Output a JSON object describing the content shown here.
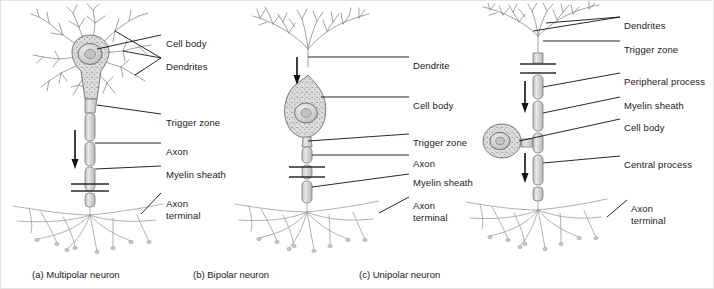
{
  "figure": {
    "background_color": "#ffffff",
    "ink_color": "#1a1a1a",
    "cell_fill_color": "#d9d9d9",
    "process_fill_color": "#cfcfcf",
    "dendrite_stroke_color": "#6e6e6e",
    "terminal_stroke_color": "#9a9a9a"
  },
  "panels": [
    {
      "id": "a",
      "caption": "(a) Multipolar neuron",
      "caption_x": 31,
      "caption_y": 268,
      "labels": [
        {
          "text": "Cell body",
          "x": 165,
          "y": 37
        },
        {
          "text": "Dendrites",
          "x": 165,
          "y": 60
        },
        {
          "text": "Trigger zone",
          "x": 165,
          "y": 116
        },
        {
          "text": "Axon",
          "x": 165,
          "y": 145
        },
        {
          "text": "Myelin sheath",
          "x": 165,
          "y": 168
        },
        {
          "text": "Axon",
          "x": 165,
          "y": 197
        },
        {
          "text": "terminal",
          "x": 165,
          "y": 209
        }
      ]
    },
    {
      "id": "b",
      "caption": "(b) Bipolar neuron",
      "caption_x": 192,
      "caption_y": 268,
      "labels": [
        {
          "text": "Dendrite",
          "x": 412,
          "y": 59
        },
        {
          "text": "Cell body",
          "x": 412,
          "y": 99
        },
        {
          "text": "Trigger zone",
          "x": 412,
          "y": 136
        },
        {
          "text": "Axon",
          "x": 412,
          "y": 157
        },
        {
          "text": "Myelin sheath",
          "x": 412,
          "y": 176
        },
        {
          "text": "Axon",
          "x": 412,
          "y": 199
        },
        {
          "text": "terminal",
          "x": 412,
          "y": 211
        }
      ]
    },
    {
      "id": "c",
      "caption": "(c) Unipolar neuron",
      "caption_x": 358,
      "caption_y": 268,
      "labels": [
        {
          "text": "Dendrites",
          "x": 623,
          "y": 19
        },
        {
          "text": "Trigger zone",
          "x": 623,
          "y": 43
        },
        {
          "text": "Peripheral process",
          "x": 623,
          "y": 75
        },
        {
          "text": "Myelin sheath",
          "x": 623,
          "y": 99
        },
        {
          "text": "Cell body",
          "x": 623,
          "y": 121
        },
        {
          "text": "Central process",
          "x": 623,
          "y": 158
        },
        {
          "text": "Axon",
          "x": 630,
          "y": 202
        },
        {
          "text": "terminal",
          "x": 630,
          "y": 214
        }
      ]
    }
  ],
  "annotations": {
    "direction_arrow_name": "signal-direction-arrow",
    "arrow_count": 4
  }
}
